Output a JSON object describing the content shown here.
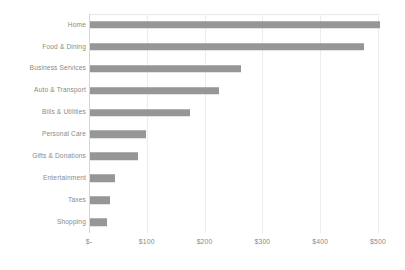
{
  "chart_data": {
    "type": "bar",
    "orientation": "horizontal",
    "title": "",
    "subtitle": "",
    "xlabel": "",
    "ylabel": "",
    "categories": [
      "Home",
      "Food & Dining",
      "Business Services",
      "Auto & Transport",
      "Bills & Utilities",
      "Personal Care",
      "Gifts & Donations",
      "Entertainment",
      "Taxes",
      "Shopping"
    ],
    "values": [
      502,
      474,
      261,
      223,
      173,
      97,
      83,
      43,
      35,
      29
    ],
    "xlim": [
      0,
      500
    ],
    "xticks": [
      0,
      100,
      200,
      300,
      400,
      500
    ],
    "xtick_labels": [
      "$-",
      "$100",
      "$200",
      "$300",
      "$400",
      "$500"
    ],
    "grid": true,
    "grid_axis": "x",
    "legend": false,
    "legend_position": "none",
    "bar_color": "#969696",
    "gridline_color": "#ededed",
    "axis_line_color": "#d6d6d6",
    "label_color": "#8a8a8a",
    "background_color": "#ffffff"
  }
}
